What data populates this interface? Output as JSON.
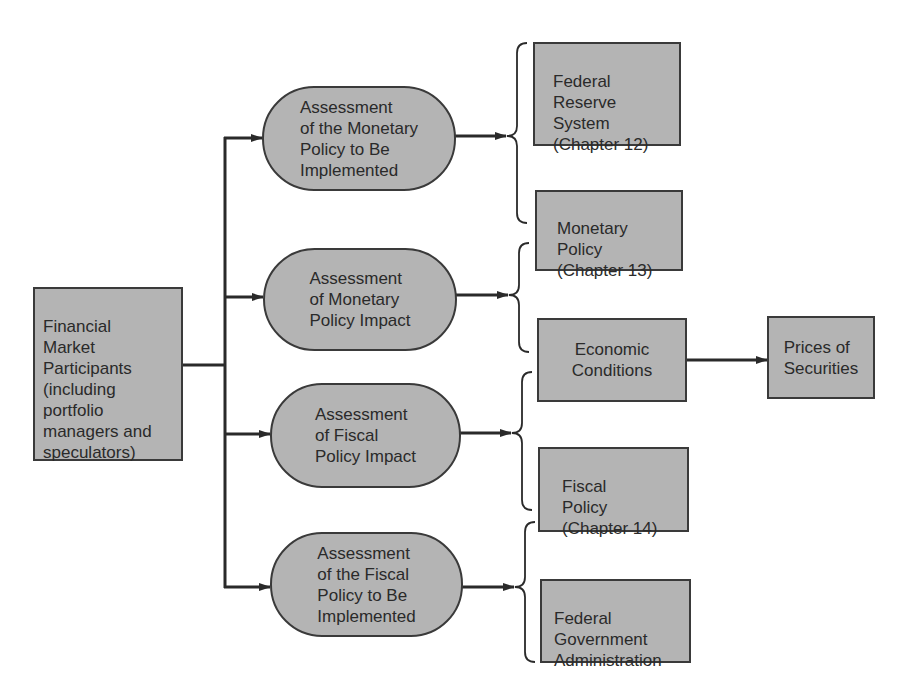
{
  "diagram": {
    "type": "flowchart",
    "source_node": {
      "label": "Financial\nMarket\nParticipants\n(including\nportfolio\nmanagers and\nspeculators)"
    },
    "assessments": [
      {
        "label": "Assessment\nof the Monetary\nPolicy to Be\nImplemented"
      },
      {
        "label": "Assessment\nof Monetary\nPolicy Impact"
      },
      {
        "label": "Assessment\nof Fiscal\nPolicy Impact"
      },
      {
        "label": "Assessment\nof the Fiscal\nPolicy to Be\nImplemented"
      }
    ],
    "factors": [
      {
        "label": "Federal\nReserve\nSystem\n(Chapter 12)"
      },
      {
        "label": "Monetary\nPolicy\n(Chapter 13)"
      },
      {
        "label": "Economic\nConditions"
      },
      {
        "label": "Fiscal\nPolicy\n(Chapter 14)"
      },
      {
        "label": "Federal\nGovernment\nAdministration"
      }
    ],
    "outcome": {
      "label": "Prices of\nSecurities"
    },
    "edges": [
      {
        "from": "Financial Market Participants",
        "to": "Assessment of the Monetary Policy to Be Implemented"
      },
      {
        "from": "Financial Market Participants",
        "to": "Assessment of Monetary Policy Impact"
      },
      {
        "from": "Financial Market Participants",
        "to": "Assessment of Fiscal Policy Impact"
      },
      {
        "from": "Financial Market Participants",
        "to": "Assessment of the Fiscal Policy to Be Implemented"
      },
      {
        "from": "Assessment of the Monetary Policy to Be Implemented",
        "to": [
          "Federal Reserve System",
          "Monetary Policy"
        ]
      },
      {
        "from": "Assessment of Monetary Policy Impact",
        "to": [
          "Monetary Policy",
          "Economic Conditions"
        ]
      },
      {
        "from": "Assessment of Fiscal Policy Impact",
        "to": [
          "Economic Conditions",
          "Fiscal Policy"
        ]
      },
      {
        "from": "Assessment of the Fiscal Policy to Be Implemented",
        "to": [
          "Fiscal Policy",
          "Federal Government Administration"
        ]
      },
      {
        "from": "Economic Conditions",
        "to": "Prices of Securities"
      }
    ],
    "colors": {
      "node_fill": "#b4b4b4",
      "line": "#2a2a2a",
      "text": "#2a2a2a",
      "background": "#ffffff"
    }
  }
}
